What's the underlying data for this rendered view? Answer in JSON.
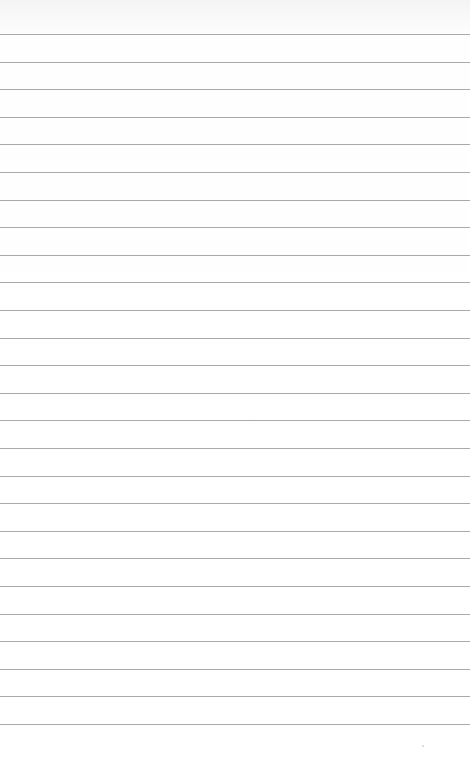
{
  "notepad": {
    "line_count": 26,
    "first_line_y": 34,
    "line_spacing": 27.6,
    "line_color": "#a9a9a9",
    "paper_color": "#ffffff"
  }
}
